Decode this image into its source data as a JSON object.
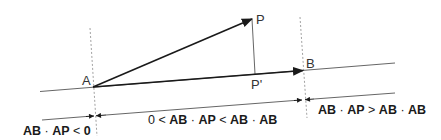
{
  "diagram": {
    "type": "vector-projection",
    "points": {
      "A": {
        "label": "A"
      },
      "B": {
        "label": "B"
      },
      "P": {
        "label": "P"
      },
      "P_prime": {
        "label": "P'"
      }
    },
    "regions": {
      "left": {
        "vec1": "AB",
        "dot": "·",
        "vec2": "AP",
        "rel": "<",
        "rhs": "0"
      },
      "middle": {
        "lhs": "0",
        "rel1": "<",
        "vec1": "AB",
        "dot1": "·",
        "vec2": "AP",
        "rel2": "<",
        "vec3": "AB",
        "dot2": "·",
        "vec4": "AB"
      },
      "right": {
        "vec1": "AB",
        "dot1": "·",
        "vec2": "AP",
        "rel": ">",
        "vec3": "AB",
        "dot2": "·",
        "vec4": "AB"
      }
    },
    "colors": {
      "vector": "#1a1a1a",
      "line": "#555555",
      "dashed": "#888888",
      "text": "#1a1a1a"
    }
  }
}
